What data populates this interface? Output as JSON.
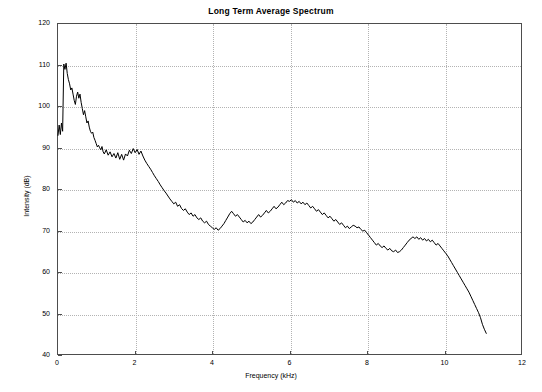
{
  "chart_data": {
    "type": "line",
    "title": "Long Term Average Spectrum",
    "xlabel": "Frequency (kHz)",
    "ylabel": "Intensity (dB)",
    "xlim": [
      0,
      12
    ],
    "ylim": [
      40,
      120
    ],
    "xticks": [
      0,
      2,
      4,
      6,
      8,
      10,
      12
    ],
    "yticks": [
      40,
      50,
      60,
      70,
      80,
      90,
      100,
      110,
      120
    ],
    "xtick_labels": [
      "0",
      "2",
      "4",
      "6",
      "8",
      "10",
      "12"
    ],
    "ytick_labels": [
      "40",
      "50",
      "60",
      "70",
      "80",
      "90",
      "100",
      "110",
      "120"
    ],
    "grid": true,
    "grid_style": "dotted",
    "legend": null,
    "line_color": "#000000",
    "line_width": 1,
    "series": [
      {
        "name": "Long term average spectrum",
        "x": [
          0.0,
          0.03,
          0.06,
          0.09,
          0.12,
          0.15,
          0.18,
          0.21,
          0.24,
          0.27,
          0.3,
          0.33,
          0.36,
          0.39,
          0.42,
          0.45,
          0.48,
          0.51,
          0.54,
          0.57,
          0.6,
          0.63,
          0.66,
          0.69,
          0.72,
          0.75,
          0.78,
          0.81,
          0.84,
          0.87,
          0.9,
          0.93,
          0.96,
          0.99,
          1.02,
          1.05,
          1.08,
          1.11,
          1.14,
          1.17,
          1.2,
          1.25,
          1.3,
          1.35,
          1.4,
          1.45,
          1.5,
          1.55,
          1.6,
          1.65,
          1.7,
          1.75,
          1.8,
          1.85,
          1.9,
          1.95,
          2.0,
          2.05,
          2.1,
          2.15,
          2.2,
          2.25,
          2.3,
          2.35,
          2.4,
          2.45,
          2.5,
          2.55,
          2.6,
          2.65,
          2.7,
          2.75,
          2.8,
          2.85,
          2.9,
          2.95,
          3.0,
          3.05,
          3.1,
          3.15,
          3.2,
          3.25,
          3.3,
          3.35,
          3.4,
          3.45,
          3.5,
          3.55,
          3.6,
          3.65,
          3.7,
          3.75,
          3.8,
          3.85,
          3.9,
          3.95,
          4.0,
          4.05,
          4.1,
          4.15,
          4.2,
          4.25,
          4.3,
          4.35,
          4.4,
          4.45,
          4.5,
          4.55,
          4.6,
          4.65,
          4.7,
          4.75,
          4.8,
          4.85,
          4.9,
          4.95,
          5.0,
          5.05,
          5.1,
          5.15,
          5.2,
          5.25,
          5.3,
          5.35,
          5.4,
          5.45,
          5.5,
          5.55,
          5.6,
          5.65,
          5.7,
          5.75,
          5.8,
          5.85,
          5.9,
          5.95,
          6.0,
          6.05,
          6.1,
          6.15,
          6.2,
          6.25,
          6.3,
          6.35,
          6.4,
          6.45,
          6.5,
          6.55,
          6.6,
          6.65,
          6.7,
          6.75,
          6.8,
          6.85,
          6.9,
          6.95,
          7.0,
          7.05,
          7.1,
          7.15,
          7.2,
          7.25,
          7.3,
          7.35,
          7.4,
          7.45,
          7.5,
          7.55,
          7.6,
          7.65,
          7.7,
          7.75,
          7.8,
          7.85,
          7.9,
          7.95,
          8.0,
          8.05,
          8.1,
          8.15,
          8.2,
          8.25,
          8.3,
          8.35,
          8.4,
          8.45,
          8.5,
          8.55,
          8.6,
          8.65,
          8.7,
          8.75,
          8.8,
          8.85,
          8.9,
          8.95,
          9.0,
          9.05,
          9.1,
          9.15,
          9.2,
          9.25,
          9.3,
          9.35,
          9.4,
          9.45,
          9.5,
          9.55,
          9.6,
          9.65,
          9.7,
          9.75,
          9.8,
          9.85,
          9.9,
          9.95,
          10.0,
          10.05,
          10.1,
          10.15,
          10.2,
          10.25,
          10.3,
          10.35,
          10.4,
          10.45,
          10.5,
          10.55,
          10.6,
          10.65,
          10.7,
          10.75,
          10.8,
          10.85,
          10.9,
          10.95,
          11.0,
          11.05,
          11.1
        ],
        "y": [
          93.0,
          95.5,
          93.2,
          96.0,
          94.0,
          110.3,
          109.0,
          110.5,
          108.0,
          106.5,
          105.5,
          104.0,
          104.5,
          103.0,
          101.5,
          100.5,
          102.5,
          103.5,
          102.0,
          103.0,
          101.0,
          99.5,
          98.0,
          99.0,
          97.5,
          96.0,
          96.5,
          95.0,
          94.0,
          93.5,
          93.8,
          92.5,
          91.8,
          91.0,
          90.2,
          90.6,
          90.0,
          89.5,
          90.3,
          89.0,
          88.5,
          89.5,
          88.2,
          89.0,
          87.8,
          88.6,
          87.5,
          88.8,
          87.2,
          88.4,
          87.0,
          88.5,
          88.0,
          89.4,
          88.6,
          89.8,
          88.8,
          89.6,
          88.4,
          89.2,
          88.0,
          87.0,
          86.2,
          85.5,
          84.8,
          84.0,
          83.2,
          82.5,
          81.8,
          81.0,
          80.3,
          79.6,
          79.0,
          78.3,
          77.6,
          77.0,
          76.4,
          76.8,
          75.8,
          76.2,
          75.3,
          74.8,
          75.2,
          74.4,
          73.8,
          74.2,
          73.4,
          73.8,
          73.0,
          72.6,
          73.0,
          72.2,
          71.8,
          72.2,
          71.4,
          71.0,
          70.6,
          70.2,
          70.6,
          70.0,
          70.4,
          71.0,
          71.6,
          72.4,
          73.2,
          74.0,
          74.6,
          74.0,
          73.4,
          73.8,
          73.2,
          72.6,
          72.0,
          72.4,
          71.8,
          72.2,
          71.6,
          72.0,
          72.6,
          73.2,
          73.8,
          73.2,
          73.6,
          74.2,
          74.8,
          74.2,
          74.6,
          75.2,
          75.8,
          75.2,
          75.6,
          76.2,
          76.8,
          76.2,
          76.6,
          77.2,
          77.0,
          77.4,
          76.8,
          77.2,
          76.6,
          77.0,
          76.4,
          76.8,
          76.2,
          76.6,
          76.0,
          75.4,
          75.8,
          75.2,
          74.6,
          75.0,
          74.4,
          73.8,
          74.2,
          73.6,
          73.0,
          73.4,
          72.8,
          72.2,
          72.6,
          72.0,
          71.4,
          71.8,
          71.2,
          70.6,
          71.0,
          70.4,
          70.8,
          71.2,
          71.0,
          70.6,
          70.8,
          70.2,
          69.8,
          70.0,
          69.4,
          68.8,
          68.2,
          67.6,
          67.0,
          66.4,
          66.8,
          66.2,
          65.8,
          66.2,
          65.6,
          65.2,
          65.6,
          65.0,
          64.8,
          65.2,
          64.6,
          64.8,
          65.2,
          65.8,
          66.4,
          67.0,
          67.6,
          68.0,
          68.4,
          68.0,
          68.4,
          67.8,
          68.2,
          67.6,
          68.0,
          67.4,
          67.8,
          67.2,
          67.6,
          67.0,
          66.4,
          66.8,
          66.2,
          65.6,
          65.0,
          64.4,
          63.8,
          63.0,
          62.2,
          61.4,
          60.6,
          59.8,
          59.0,
          58.2,
          57.4,
          56.6,
          55.8,
          55.0,
          54.0,
          53.0,
          52.0,
          51.0,
          50.0,
          48.8,
          47.2,
          46.0,
          45.0
        ]
      }
    ]
  }
}
